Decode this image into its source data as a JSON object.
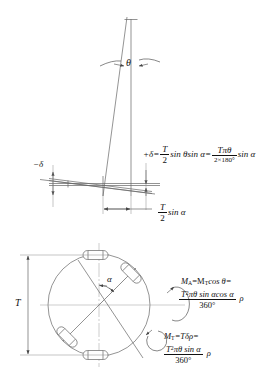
{
  "figure": {
    "kind": "engineering-diagram",
    "background": "#ffffff",
    "stroke": "#555555",
    "text_color": "#111111"
  },
  "top_view": {
    "angle_label": "θ",
    "note": "tilted shaft showing angular misalignment theta between vertical axis and shaft centerline"
  },
  "middle_view": {
    "neg_delta_label": "−δ",
    "deflection_formula": {
      "lhs": "+δ=",
      "frac1_num": "T",
      "frac1_den": "2",
      "mid": "sin θsin α=",
      "frac2_num": "Tπθ",
      "frac2_den": "2×180°",
      "tail": "sin α"
    },
    "dimension_label": {
      "num": "T",
      "den": "2",
      "tail": "sin α"
    }
  },
  "bottom_view": {
    "diameter_label": "T",
    "alpha_label": "α",
    "roller_count": 4,
    "formula_ma": {
      "line1": "=M",
      "lhs_sym": "M",
      "lhs_sub": "A",
      "rhs_sym": "M",
      "rhs_sub": "T",
      "line1_tail": "cos θ=",
      "num_a": "T",
      "num_sup": "2",
      "num_b": "πθ sin αcos α",
      "den": "360°",
      "rho": "ρ"
    },
    "formula_mt": {
      "lhs_sym": "M",
      "lhs_sub": "T",
      "line1_tail": "=Tδρ=",
      "num_a": "T",
      "num_sup": "2",
      "num_b": "πθ sin α",
      "den": "360°",
      "rho": "ρ"
    }
  },
  "caption": {
    "text": ""
  }
}
